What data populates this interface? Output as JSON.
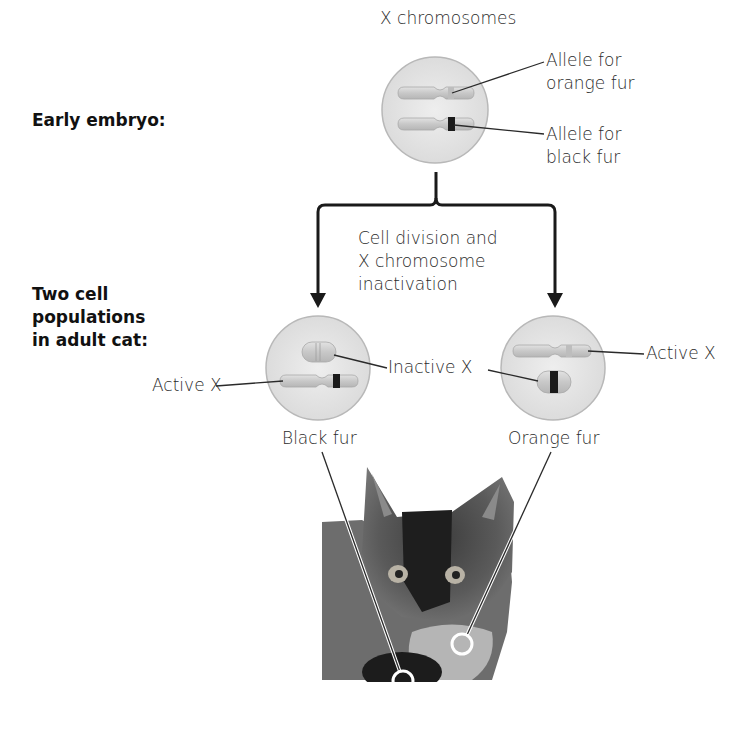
{
  "stages": {
    "early": "Early embryo:",
    "adult": [
      "Two cell",
      "populations",
      "in adult cat:"
    ]
  },
  "top_cell": {
    "title": "X chromosomes",
    "allele_orange": [
      "Allele for",
      "orange fur"
    ],
    "allele_black": [
      "Allele for",
      "black fur"
    ]
  },
  "process": [
    "Cell division and",
    "X chromosome",
    "inactivation"
  ],
  "left_cell": {
    "active_label": "Active X",
    "caption": "Black fur"
  },
  "right_cell": {
    "active_label": "Active X",
    "caption": "Orange fur"
  },
  "shared": {
    "inactive_label": "Inactive X"
  },
  "colors": {
    "cell_fill": "#e6e6e6",
    "cell_stroke": "#b5b5b5",
    "chromosome": "#cfcfcf",
    "black_band": "#1a1a1a",
    "arrow": "#1a1a1a"
  }
}
